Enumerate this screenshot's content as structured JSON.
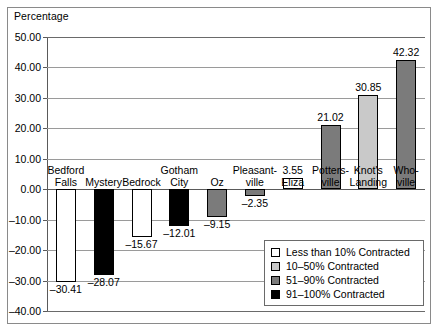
{
  "figure": {
    "axis_title": "Percentage"
  },
  "chart_data": {
    "type": "bar",
    "title": "",
    "xlabel": "",
    "ylabel": "Percentage",
    "ylim": [
      -40.0,
      50.0
    ],
    "ytick_labels": [
      "50.00",
      "40.00",
      "30.00",
      "20.00",
      "10.00",
      "0.00",
      "-10.00",
      "-20.00",
      "-30.00",
      "-40.00"
    ],
    "ytick_values": [
      50,
      40,
      30,
      20,
      10,
      0,
      -10,
      -20,
      -30,
      -40
    ],
    "grid": true,
    "legend_position": "inside-bottom-right",
    "categories": [
      "Bedford Falls",
      "Mystery",
      "Bedrock",
      "Gotham City",
      "Oz",
      "Pleasant-ville",
      "Eliza",
      "Potters-ville",
      "Knot's Landing",
      "Who-ville"
    ],
    "category_lines": [
      [
        "Bedford",
        "Falls"
      ],
      [
        "Mystery"
      ],
      [
        "Bedrock"
      ],
      [
        "Gotham",
        "City"
      ],
      [
        "Oz"
      ],
      [
        "Pleasant-",
        "ville"
      ],
      [
        "Eliza"
      ],
      [
        "Potters-",
        "ville"
      ],
      [
        "Knot's",
        "Landing"
      ],
      [
        "Who-",
        "ville"
      ]
    ],
    "values": [
      -30.41,
      -28.07,
      -15.67,
      -12.01,
      -9.15,
      -2.35,
      3.55,
      21.02,
      30.85,
      42.32
    ],
    "value_labels": [
      "-30.41",
      "-28.07",
      "-15.67",
      "-12.01",
      "-9.15",
      "-2.35",
      "3.55",
      "21.02",
      "30.85",
      "42.32"
    ],
    "series_keys": [
      "lt10",
      "lt10",
      "lt10",
      "91to100",
      "51to90",
      "51to90",
      "lt10",
      "51to90",
      "10to50",
      "51to90"
    ],
    "bar_fill_classes": [
      "sw-white",
      "sw-black",
      "sw-white",
      "sw-black",
      "sw-dark",
      "sw-dark",
      "sw-white",
      "sw-dark",
      "sw-light",
      "sw-dark"
    ],
    "colors": {
      "lt10": "#ffffff",
      "10to50": "#c9c9c9",
      "51to90": "#7b7b7b",
      "91to100": "#000000",
      "gridline": "#9a9a9a",
      "axis": "#5a5a5a",
      "frame": "#8a8a8a"
    },
    "legend": [
      {
        "label": "Less than 10% Contracted",
        "swatch_class": "sw-white"
      },
      {
        "label": "10–50% Contracted",
        "swatch_class": "sw-light"
      },
      {
        "label": "51–90% Contracted",
        "swatch_class": "sw-dark"
      },
      {
        "label": "91–100% Contracted",
        "swatch_class": "sw-black"
      }
    ]
  }
}
